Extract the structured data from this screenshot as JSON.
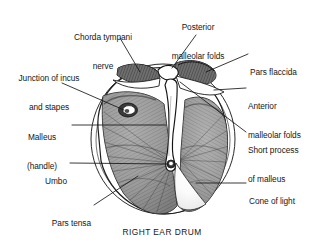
{
  "figure": {
    "title": "RIGHT EAR DRUM",
    "background_color": "#ffffff",
    "ink_color": "#161616",
    "membrane_fill": "#9a9a9a",
    "highlight_color": "#ffffff"
  },
  "labels": [
    {
      "id": "chorda-tympani-nerve",
      "line1": "Chorda tympani",
      "line2": "nerve",
      "align": "center"
    },
    {
      "id": "posterior-malleolar-folds",
      "line1": "Posterior",
      "line2": "malleolar folds",
      "align": "center"
    },
    {
      "id": "pars-flaccida",
      "line1": "Pars flaccida",
      "line2": "",
      "align": "left"
    },
    {
      "id": "anterior-malleolar-folds",
      "line1": "Anterior",
      "line2": "malleolar folds",
      "align": "left"
    },
    {
      "id": "short-process-of-malleus",
      "line1": "Short process",
      "line2": "of malleus",
      "align": "left"
    },
    {
      "id": "cone-of-light",
      "line1": "Cone of light",
      "line2": "",
      "align": "left"
    },
    {
      "id": "junction-of-incus-and-stapes",
      "line1": "Junction of incus",
      "line2": "and stapes",
      "align": "center"
    },
    {
      "id": "malleus-handle",
      "line1": "Malleus",
      "line2": "(handle)",
      "align": "center"
    },
    {
      "id": "umbo",
      "line1": "Umbo",
      "line2": "",
      "align": "right"
    },
    {
      "id": "pars-tensa",
      "line1": "Pars tensa",
      "line2": "",
      "align": "right"
    }
  ],
  "caption": "RIGHT EAR DRUM"
}
